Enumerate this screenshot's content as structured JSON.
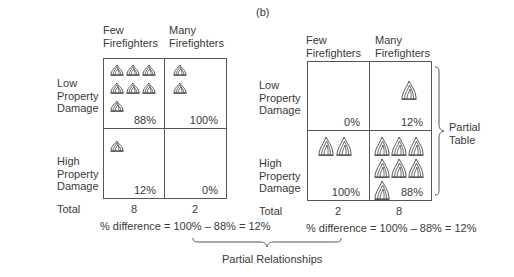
{
  "figure_label": "(b)",
  "left_table": {
    "col_headers": [
      "Few\nFirefighters",
      "Many\nFirefighters"
    ],
    "row_labels": [
      "Low\nProperty\nDamage",
      "High\nProperty\nDamage"
    ],
    "cells": {
      "low_few": {
        "pct": "88%",
        "count": 7
      },
      "low_many": {
        "pct": "100%",
        "count": 2
      },
      "high_few": {
        "pct": "12%",
        "count": 1
      },
      "high_many": {
        "pct": "0%",
        "count": 0
      }
    },
    "total_label": "Total",
    "totals": [
      "8",
      "2"
    ],
    "difference": "% difference = 100% – 88% = 12%"
  },
  "right_table": {
    "col_headers": [
      "Few\nFirefighters",
      "Many\nFirefighters"
    ],
    "row_labels": [
      "Low\nProperty\nDamage",
      "High\nProperty\nDamage"
    ],
    "cells": {
      "low_few": {
        "pct": "0%",
        "count": 0
      },
      "low_many": {
        "pct": "12%",
        "count": 1
      },
      "high_few": {
        "pct": "100%",
        "count": 2
      },
      "high_many": {
        "pct": "88%",
        "count": 7
      }
    },
    "total_label": "Total",
    "totals": [
      "2",
      "8"
    ],
    "difference": "% difference = 100% – 88% = 12%",
    "brace_label": "Partial\nTable"
  },
  "bottom_brace_label": "Partial Relationships",
  "icons": {
    "fire": "fire-icon"
  },
  "colors": {
    "line": "#555555",
    "text": "#3a3a3a",
    "background": "#ffffff"
  }
}
